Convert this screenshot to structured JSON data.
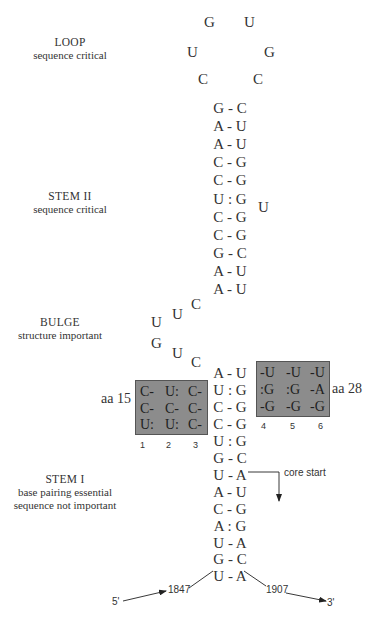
{
  "regions": {
    "loop": {
      "title": "LOOP",
      "subtitle": "sequence critical"
    },
    "stem2": {
      "title": "STEM II",
      "subtitle": "sequence critical"
    },
    "bulge": {
      "title": "BULGE",
      "subtitle": "structure important"
    },
    "stem1": {
      "title": "STEM I",
      "subtitle": "base pairing essential",
      "subtitle2": "sequence not important"
    }
  },
  "loop_nts": [
    "G",
    "U",
    "U",
    "G",
    "C",
    "C"
  ],
  "stem2_pairs": [
    "G - C",
    "A - U",
    "A - U",
    "C - G",
    "C - G",
    "U : G",
    "C - G",
    "C - G",
    "G - C",
    "A - U",
    "A - U"
  ],
  "stem2_bulge_nt": "U",
  "bulge_nts": [
    "C",
    "U",
    "U",
    "G",
    "U",
    "C"
  ],
  "stem1_pairs": [
    "A - U",
    "U : G",
    "C - G",
    "C - G",
    "U : G",
    "G - C",
    "U - A",
    "A - U",
    "C - G",
    "A : G",
    "U - A",
    "G - C",
    "U - A"
  ],
  "left_box": {
    "label": "aa 15",
    "rows": [
      [
        "C-",
        "U:",
        "C-"
      ],
      [
        "C-",
        "C-",
        "C-"
      ],
      [
        "U:",
        "U:",
        "C-"
      ]
    ],
    "columns": [
      "1",
      "2",
      "3"
    ]
  },
  "right_box": {
    "label": "aa 28",
    "rows": [
      [
        "-U",
        "-U",
        "-U"
      ],
      [
        ":G",
        ":G",
        "-A"
      ],
      [
        "-G",
        "-G",
        "-G"
      ]
    ],
    "columns": [
      "4",
      "5",
      "6"
    ]
  },
  "core_start": "core start",
  "ends": {
    "five_prime": "5'",
    "three_prime": "3'",
    "start_pos": "1847",
    "end_pos": "1907"
  },
  "colors": {
    "box_fill": "#8c8c8c",
    "text": "#333333"
  }
}
